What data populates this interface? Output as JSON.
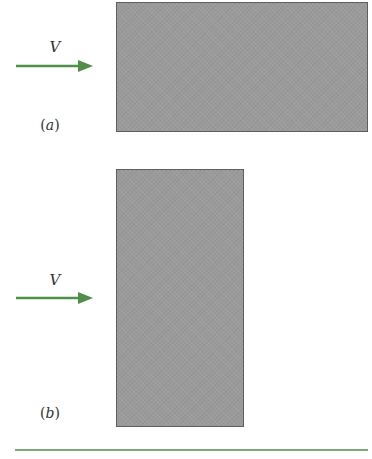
{
  "figure": {
    "panels": [
      {
        "id": "a",
        "caption_open": "(",
        "caption_letter": "a",
        "caption_close": ")",
        "velocity_label": "V",
        "plate_orientation": "horizontal"
      },
      {
        "id": "b",
        "caption_open": "(",
        "caption_letter": "b",
        "caption_close": ")",
        "velocity_label": "V",
        "plate_orientation": "vertical"
      }
    ],
    "colors": {
      "arrow": "#4f8f4a",
      "plate_fill": "#9a9a9a",
      "plate_border": "#5e5e5e",
      "rule": "#7fa878",
      "text": "#333333"
    }
  }
}
